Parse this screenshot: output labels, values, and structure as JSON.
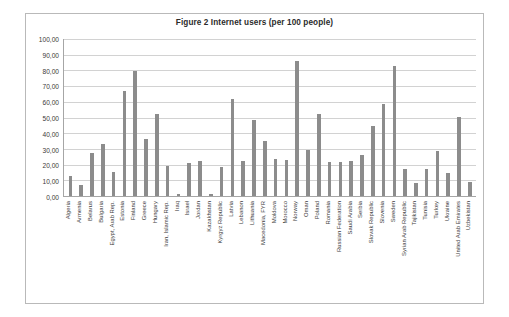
{
  "chart": {
    "title": "Figure 2 Internet users (per 100 people)",
    "border_color": "#b9b9b9",
    "bar_color": "#8c8c8c",
    "gridline_color": "#d2d2d2",
    "axis_color": "#a6a6a6",
    "background": "#ffffff"
  },
  "chart_data": {
    "type": "bar",
    "title": "Figure 2 Internet users (per 100 people)",
    "xlabel": "",
    "ylabel": "",
    "ylim": [
      0,
      100
    ],
    "ytick_labels": [
      "100,00",
      "90,00",
      "80,00",
      "70,00",
      "60,00",
      "50,00",
      "40,00",
      "30,00",
      "20,00",
      "10,00",
      "0,00"
    ],
    "ytick_values": [
      100,
      90,
      80,
      70,
      60,
      50,
      40,
      30,
      20,
      10,
      0
    ],
    "grid": true,
    "legend": false,
    "legend_position": "none",
    "categories": [
      "Algeria",
      "Armenia",
      "Belarus",
      "Bulgaria",
      "Egypt, Arab Rep.",
      "Estonia",
      "Finland",
      "Greece",
      "Hungary",
      "Iran, Islamic Rep.",
      "Iraq",
      "Israel",
      "Jordan",
      "Kazakhstan",
      "Kyrgyz Republic",
      "Latvia",
      "Lebanon",
      "Lithuania",
      "Macedonia, FYR",
      "Moldova",
      "Morocco",
      "Norway",
      "Oman",
      "Poland",
      "Romania",
      "Russian Federation",
      "Saudi Arabia",
      "Serbia",
      "Slovak Republic",
      "Slovenia",
      "Sweden",
      "Syrian Arab Republic",
      "Tajikistan",
      "Tunisia",
      "Turkey",
      "Ukraine",
      "United Arab Emirates",
      "Uzbekistan"
    ],
    "values": [
      12.5,
      7.0,
      27.4,
      33.1,
      15.4,
      66.9,
      79.7,
      36.4,
      52.2,
      19.0,
      1.1,
      21.2,
      22.5,
      1.5,
      18.2,
      62.1,
      22.5,
      48.3,
      35.0,
      23.4,
      22.7,
      86.0,
      29.6,
      52.0,
      21.4,
      21.7,
      22.0,
      26.0,
      44.3,
      58.5,
      82.5,
      17.1,
      8.5,
      17.1,
      28.6,
      14.6,
      50.3,
      9.1
    ]
  }
}
